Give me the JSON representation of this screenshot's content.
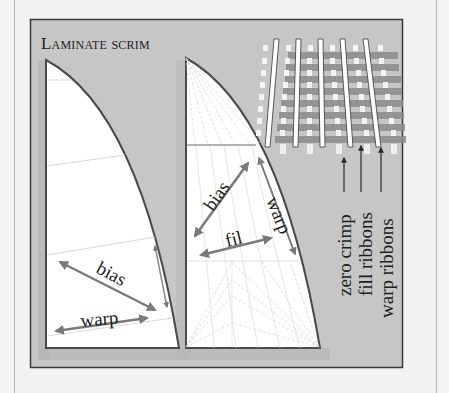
{
  "diagram": {
    "title": "Laminate scrim",
    "left_sail": {
      "labels": {
        "bias": "bias",
        "warp": "warp"
      }
    },
    "middle_sail": {
      "labels": {
        "bias": "bias",
        "warp": "warp",
        "fill": "fil"
      }
    },
    "weave": {
      "callouts": [
        {
          "label": "zero crimp"
        },
        {
          "label": "fill ribbons"
        },
        {
          "label": "warp ribbons"
        }
      ]
    }
  },
  "colors": {
    "page_bg": "#f2f2f2",
    "panel_bg": "#c6c6c6",
    "panel_border": "#3a3a3a",
    "sail_fill": "#ffffff",
    "sail_edge": "#4a4a4a",
    "arrow": "#7a7a7a",
    "text": "#1e1e1e"
  }
}
